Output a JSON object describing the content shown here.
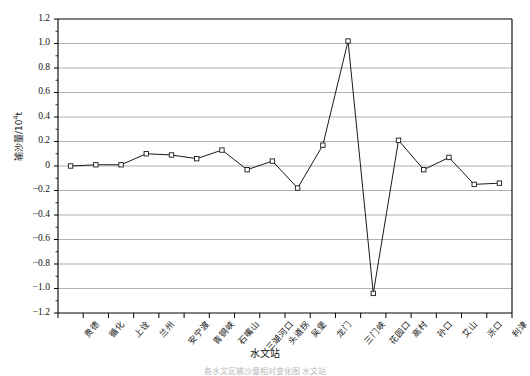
{
  "chart_data": {
    "type": "line",
    "title": "",
    "xlabel": "水文站",
    "ylabel": "输沙量/10⁴t",
    "ylabel_main": "输沙量/10",
    "ylabel_exp": "4",
    "ylabel_unit": "t",
    "ylim": [
      -1.2,
      1.2
    ],
    "ytick_step": 0.2,
    "ytick_labels": [
      "1.2",
      "1.0",
      "0.8",
      "0.6",
      "0.4",
      "0.2",
      "0",
      "−0.2",
      "−0.4",
      "−0.6",
      "−0.8",
      "−1.0",
      "−1.2"
    ],
    "ytick_values": [
      1.2,
      1.0,
      0.8,
      0.6,
      0.4,
      0.2,
      0,
      -0.2,
      -0.4,
      -0.6,
      -0.8,
      -1.0,
      -1.2
    ],
    "grid": true,
    "grid_axis": "y",
    "legend": "none",
    "marker": "open-square",
    "line_color": "#1a1a1a",
    "grid_color": "#9a9a9a",
    "axis_color": "#000000",
    "categories": [
      "贵德",
      "循化",
      "上诠",
      "兰州",
      "安宁渡",
      "青铜峡",
      "石嘴山",
      "三湖河口",
      "头道拐",
      "吴堡",
      "龙门",
      "三门峡",
      "花园口",
      "高村",
      "孙口",
      "艾山",
      "泺口",
      "利津"
    ],
    "values": [
      0.0,
      0.01,
      0.01,
      0.1,
      0.09,
      0.06,
      0.13,
      -0.03,
      0.04,
      -0.18,
      0.17,
      1.02,
      -1.04,
      0.21,
      -0.03,
      0.07,
      -0.15,
      -0.14
    ],
    "series": [
      {
        "name": "输沙量",
        "values": [
          0.0,
          0.01,
          0.01,
          0.1,
          0.09,
          0.06,
          0.13,
          -0.03,
          0.04,
          -0.18,
          0.17,
          1.02,
          -1.04,
          0.21,
          -0.03,
          0.07,
          -0.15,
          -0.14
        ]
      }
    ]
  },
  "figure": {
    "caption": "各水文区输沙量相对变化图 水文站"
  }
}
